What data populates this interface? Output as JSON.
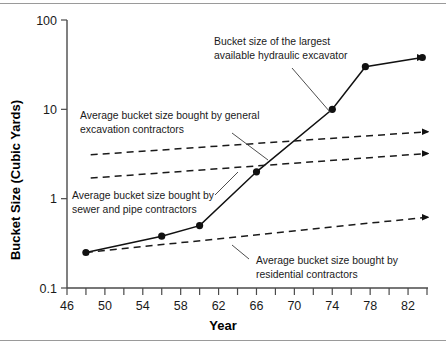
{
  "figure": {
    "has_top_rule": true,
    "has_bottom_rule": true,
    "background": "#ffffff",
    "ink": "#111111"
  },
  "chart_data": {
    "type": "line",
    "title": "",
    "xlabel": "Year",
    "ylabel": "Bucket Size (Cubic Yards)",
    "xlim": [
      46,
      84
    ],
    "ylim": [
      0.1,
      100
    ],
    "yscale": "log",
    "xscale": "linear",
    "grid": false,
    "legend_position": "none (inline annotations)",
    "x_ticks_major": [
      46,
      50,
      54,
      58,
      62,
      66,
      70,
      74,
      78,
      82
    ],
    "x_ticks_minor": [
      48,
      52,
      56,
      60,
      64,
      68,
      72,
      76,
      80,
      84
    ],
    "y_ticks_major": [
      0.1,
      1,
      10,
      100
    ],
    "y_tick_labels": [
      "0.1",
      "1",
      "10",
      "100"
    ],
    "series": [
      {
        "name": "Bucket size of the largest available hydraulic excavator",
        "style": "solid-with-markers",
        "markers": true,
        "arrow_end": true,
        "x": [
          48,
          56,
          60,
          66,
          74,
          77.5,
          83.5
        ],
        "values": [
          0.25,
          0.38,
          0.5,
          2.0,
          10.0,
          30.0,
          38.0
        ]
      },
      {
        "name": "Average bucket size bought by general excavation contractors",
        "style": "dashed",
        "markers": false,
        "arrow_end": true,
        "x": [
          48.5,
          84
        ],
        "values": [
          3.1,
          5.6
        ]
      },
      {
        "name": "Average bucket size bought by sewer and pipe contractors",
        "style": "dashed",
        "markers": false,
        "arrow_end": true,
        "x": [
          48.5,
          84
        ],
        "values": [
          1.7,
          3.2
        ]
      },
      {
        "name": "Average bucket size bought by residential contractors",
        "style": "dashed",
        "markers": false,
        "arrow_end": true,
        "x": [
          48,
          84
        ],
        "values": [
          0.25,
          0.62
        ]
      }
    ],
    "annotations": [
      {
        "id": "annot-largest-excavator",
        "lines": [
          "Bucket size of the largest",
          "available hydraulic excavator"
        ],
        "text_x": 214,
        "text_y": 45,
        "leader": [
          292,
          68,
          330,
          112
        ]
      },
      {
        "id": "annot-general-excavation",
        "lines": [
          "Average bucket size bought by general",
          "excavation contractors"
        ],
        "text_x": 80,
        "text_y": 119,
        "leader": [
          232,
          133,
          268,
          160
        ]
      },
      {
        "id": "annot-sewer-pipe",
        "lines": [
          "Average bucket size bought by",
          "sewer and pipe contractors"
        ],
        "text_x": 72,
        "text_y": 199,
        "leader": [
          215,
          195,
          238,
          172
        ]
      },
      {
        "id": "annot-residential",
        "lines": [
          "Average bucket size bought by",
          "residential contractors"
        ],
        "text_x": 256,
        "text_y": 264,
        "leader": [
          249,
          259,
          232,
          245
        ]
      }
    ]
  }
}
